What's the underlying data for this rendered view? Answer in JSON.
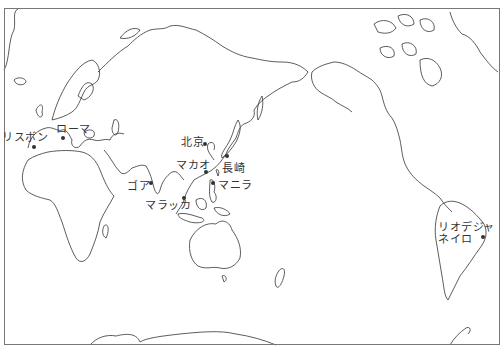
{
  "map": {
    "type": "world-outline-pacific-centered",
    "frame_color": "#777777",
    "coast_color": "#333333",
    "cities": [
      {
        "id": "lisbon",
        "label": "リスボン",
        "x": 34,
        "y": 147,
        "lx": 2,
        "ly": 132
      },
      {
        "id": "rome",
        "label": "ローマ",
        "x": 63,
        "y": 138,
        "lx": 56,
        "ly": 124
      },
      {
        "id": "goa",
        "label": "ゴア",
        "x": 151,
        "y": 183,
        "lx": 127,
        "ly": 181
      },
      {
        "id": "malacca",
        "label": "マラッカ",
        "x": 184,
        "y": 198,
        "lx": 145,
        "ly": 200
      },
      {
        "id": "beijing",
        "label": "北京",
        "x": 205,
        "y": 144,
        "lx": 181,
        "ly": 137
      },
      {
        "id": "macao",
        "label": "マカオ",
        "x": 206,
        "y": 172,
        "lx": 176,
        "ly": 160
      },
      {
        "id": "nagasaki",
        "label": "長崎",
        "x": 227,
        "y": 156,
        "lx": 222,
        "ly": 163
      },
      {
        "id": "manila",
        "label": "マニラ",
        "x": 213,
        "y": 183,
        "lx": 218,
        "ly": 180
      },
      {
        "id": "rio",
        "label": "リオデジャ",
        "label2": "ネイロ",
        "x": 483,
        "y": 237,
        "lx": 438,
        "ly": 222
      }
    ]
  }
}
